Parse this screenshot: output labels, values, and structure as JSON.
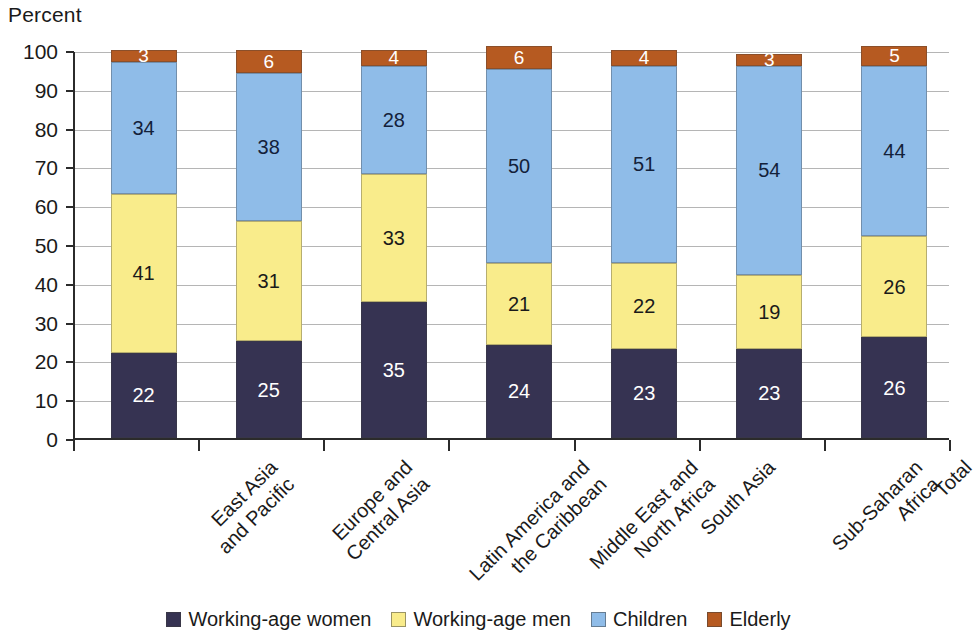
{
  "chart_data": {
    "type": "bar",
    "stacked": true,
    "title": "",
    "ylabel": "Percent",
    "xlabel": "",
    "ylim": [
      0,
      100
    ],
    "ytick_labels": [
      "0",
      "10",
      "20",
      "30",
      "40",
      "50",
      "60",
      "70",
      "80",
      "90",
      "100"
    ],
    "ytick_values": [
      0,
      10,
      20,
      30,
      40,
      50,
      60,
      70,
      80,
      90,
      100
    ],
    "grid": true,
    "grid_axis": "y",
    "legend_position": "bottom",
    "categories": [
      "East Asia and Pacific",
      "Europe and Central Asia",
      "Latin America and the Caribbean",
      "Middle East and North Africa",
      "South Asia",
      "Sub-Saharan Africa",
      "Total"
    ],
    "category_lines": [
      [
        "East Asia",
        "and Pacific"
      ],
      [
        "Europe and",
        "Central Asia"
      ],
      [
        "Latin America and",
        "the Caribbean"
      ],
      [
        "Middle East and",
        "North Africa"
      ],
      [
        "South Asia"
      ],
      [
        "Sub-Saharan",
        "Africa"
      ],
      [
        "Total"
      ]
    ],
    "series": [
      {
        "name": "Working-age women",
        "color": "#363352",
        "label_color": "#ffffff",
        "values": [
          22,
          25,
          35,
          24,
          23,
          23,
          26
        ]
      },
      {
        "name": "Working-age men",
        "color": "#f9ec8b",
        "label_color": "#1a1a1a",
        "values": [
          41,
          31,
          33,
          21,
          22,
          19,
          26
        ]
      },
      {
        "name": "Children",
        "color": "#8fbce8",
        "label_color": "#13213a",
        "values": [
          34,
          38,
          28,
          50,
          51,
          54,
          44
        ]
      },
      {
        "name": "Elderly",
        "color": "#b65a21",
        "label_color": "#ffffff",
        "values": [
          3,
          6,
          4,
          6,
          4,
          3,
          5
        ]
      }
    ]
  },
  "legend": {
    "items": [
      {
        "label": "Working-age women",
        "color": "#363352"
      },
      {
        "label": "Working-age men",
        "color": "#f9ec8b"
      },
      {
        "label": "Children",
        "color": "#8fbce8"
      },
      {
        "label": "Elderly",
        "color": "#b65a21"
      }
    ]
  }
}
